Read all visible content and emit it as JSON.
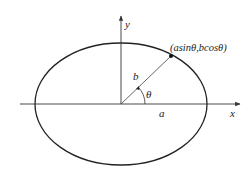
{
  "diagram": {
    "type": "ellipse-parametric",
    "labels": {
      "x_axis": "x",
      "y_axis": "y",
      "semi_axis_a": "a",
      "semi_axis_b": "b",
      "angle": "θ",
      "point": "(asinθ,bcosθ)"
    },
    "colors": {
      "stroke": "#222222",
      "background": "#ffffff"
    }
  }
}
